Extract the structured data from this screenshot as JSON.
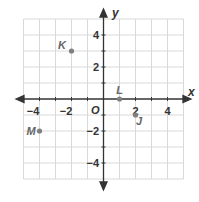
{
  "diagram": {
    "type": "coordinate-plane",
    "axes": {
      "x_label": "x",
      "y_label": "y",
      "origin_label": "O",
      "range": {
        "xmin": -5,
        "xmax": 5,
        "ymin": -5,
        "ymax": 5
      },
      "x_ticks": [
        {
          "value": -4,
          "label": "−4"
        },
        {
          "value": -2,
          "label": "−2"
        },
        {
          "value": 2,
          "label": "2"
        },
        {
          "value": 4,
          "label": "4"
        }
      ],
      "y_ticks": [
        {
          "value": 4,
          "label": "4"
        },
        {
          "value": 2,
          "label": "2"
        },
        {
          "value": -2,
          "label": "−2"
        },
        {
          "value": -4,
          "label": "−4"
        }
      ]
    },
    "points": [
      {
        "name": "K",
        "x": -2,
        "y": 3
      },
      {
        "name": "L",
        "x": 1,
        "y": 0
      },
      {
        "name": "J",
        "x": 2,
        "y": -1
      },
      {
        "name": "M",
        "x": -4,
        "y": -2
      }
    ],
    "colors": {
      "grid": "#d9d9d9",
      "axis": "#333333",
      "point": "#808080",
      "point_label": "#666666"
    }
  }
}
